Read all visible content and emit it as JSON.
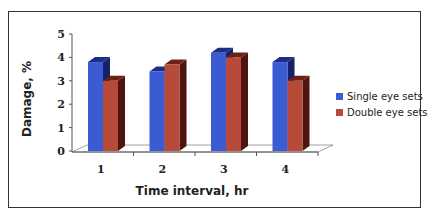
{
  "chart_data": {
    "type": "bar",
    "title": "",
    "xlabel": "Time interval, hr",
    "ylabel": "Damage, %",
    "categories": [
      "1",
      "2",
      "3",
      "4"
    ],
    "series": [
      {
        "name": "Single eye sets",
        "color": "#3a5bd1",
        "values": [
          3.8,
          3.4,
          4.2,
          3.8
        ]
      },
      {
        "name": "Double eye sets",
        "color": "#b84a3a",
        "values": [
          3.0,
          3.7,
          4.0,
          3.0
        ]
      }
    ],
    "ylim": [
      0,
      5
    ],
    "yticks": [
      "0",
      "1",
      "2",
      "3",
      "4",
      "5"
    ],
    "grid": false,
    "style": "3d-column",
    "legend_position": "right"
  }
}
